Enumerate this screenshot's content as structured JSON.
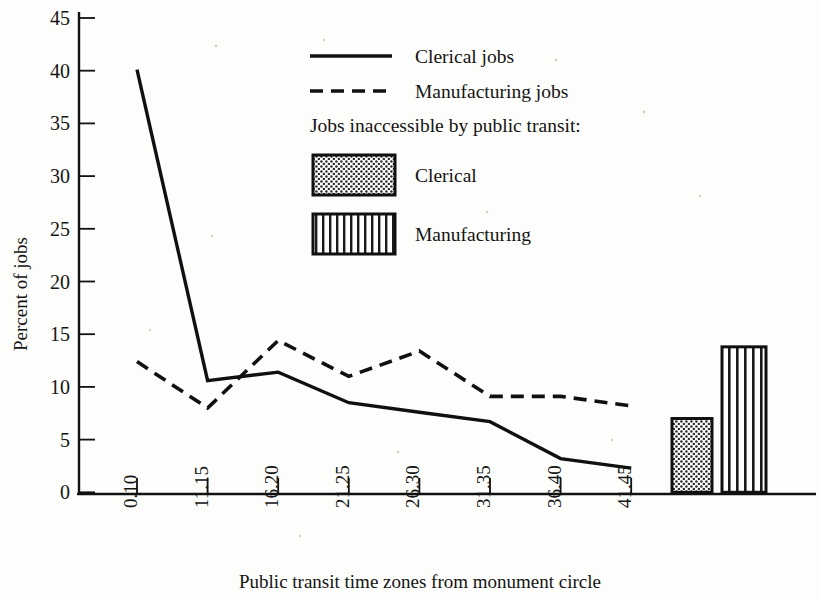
{
  "chart_data": {
    "type": "line",
    "title": "",
    "xlabel": "Public transit time zones from monument circle",
    "ylabel": "Percent of jobs",
    "ylim": [
      0,
      45
    ],
    "yticks": [
      0,
      5,
      10,
      15,
      20,
      25,
      30,
      35,
      40,
      45
    ],
    "grid": false,
    "legend_position": "upper-center",
    "categories": [
      "0.10",
      "11.15",
      "16.20",
      "21.25",
      "26.30",
      "31.35",
      "36.40",
      "41.45"
    ],
    "series": [
      {
        "name": "Clerical jobs",
        "style": "solid",
        "values": [
          40.1,
          10.6,
          11.4,
          8.5,
          7.6,
          6.7,
          3.2,
          2.3
        ]
      },
      {
        "name": "Manufacturing jobs",
        "style": "dashed",
        "values": [
          12.4,
          8.0,
          14.4,
          11.0,
          13.4,
          9.1,
          9.1,
          8.2
        ]
      }
    ],
    "bars": {
      "group_label": "Jobs inaccessible by public transit:",
      "items": [
        {
          "name": "Clerical",
          "value": 7.0,
          "pattern": "dotted"
        },
        {
          "name": "Manufacturing",
          "value": 13.8,
          "pattern": "vertical-stripes"
        }
      ]
    }
  },
  "legend": {
    "heading": "Jobs inaccessible by public transit:",
    "entries": [
      {
        "label": "Clerical jobs",
        "marker": "solid-line"
      },
      {
        "label": "Manufacturing jobs",
        "marker": "dashed-line"
      },
      {
        "label": "Clerical",
        "marker": "dotted-swatch"
      },
      {
        "label": "Manufacturing",
        "marker": "striped-swatch"
      }
    ]
  },
  "axes": {
    "y_title": "Percent of jobs",
    "x_title": "Public transit time zones from monument circle",
    "y_tick_labels": [
      "0",
      "5",
      "10",
      "15",
      "20",
      "25",
      "30",
      "35",
      "40",
      "45"
    ],
    "x_tick_labels": [
      "0.10",
      "11.15",
      "16.20",
      "21.25",
      "26.30",
      "31.35",
      "36.40",
      "41.45"
    ]
  },
  "colors": {
    "ink": "#101010",
    "paper": "#fdfdfb"
  }
}
